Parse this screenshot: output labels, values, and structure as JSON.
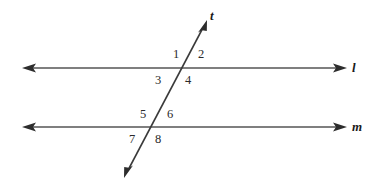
{
  "figure": {
    "type": "geometry-diagram",
    "width": 381,
    "height": 184,
    "background_color": "#ffffff",
    "stroke_color": "#555555",
    "stroke_width": 1.6,
    "text_color": "#2a2a2a"
  },
  "lines": [
    {
      "id": "line-l",
      "label": "l",
      "label_style": "bold-italic",
      "orientation": "horizontal",
      "y": 68,
      "x_start": 22,
      "x_end": 347,
      "arrow_start": true,
      "arrow_end": true,
      "label_x": 352,
      "label_y": 61
    },
    {
      "id": "line-m",
      "label": "m",
      "label_style": "bold-italic",
      "orientation": "horizontal",
      "y": 127,
      "x_start": 22,
      "x_end": 347,
      "arrow_start": true,
      "arrow_end": true,
      "label_x": 352,
      "label_y": 120
    },
    {
      "id": "line-t",
      "label": "t",
      "label_style": "bold-italic",
      "orientation": "transversal",
      "x_start": 124,
      "y_start": 178,
      "x_end": 207,
      "y_end": 20,
      "arrow_start": true,
      "arrow_end": true,
      "label_x": 210,
      "label_y": 9
    }
  ],
  "intersections": [
    {
      "id": "intersection-l-t",
      "x": 186,
      "y": 68
    },
    {
      "id": "intersection-m-t",
      "x": 147,
      "y": 127
    }
  ],
  "angle_labels": [
    {
      "id": "angle-1",
      "text": "1",
      "x": 173,
      "y": 48,
      "position": "upper-left-of-l"
    },
    {
      "id": "angle-2",
      "text": "2",
      "x": 198,
      "y": 48,
      "position": "upper-right-of-l"
    },
    {
      "id": "angle-3",
      "text": "3",
      "x": 155,
      "y": 74,
      "position": "lower-left-of-l"
    },
    {
      "id": "angle-4",
      "text": "4",
      "x": 185,
      "y": 74,
      "position": "lower-right-of-l"
    },
    {
      "id": "angle-5",
      "text": "5",
      "x": 140,
      "y": 108,
      "position": "upper-left-of-m"
    },
    {
      "id": "angle-6",
      "text": "6",
      "x": 167,
      "y": 108,
      "position": "upper-right-of-m"
    },
    {
      "id": "angle-7",
      "text": "7",
      "x": 129,
      "y": 133,
      "position": "lower-left-of-m"
    },
    {
      "id": "angle-8",
      "text": "8",
      "x": 155,
      "y": 133,
      "position": "lower-right-of-m"
    }
  ]
}
